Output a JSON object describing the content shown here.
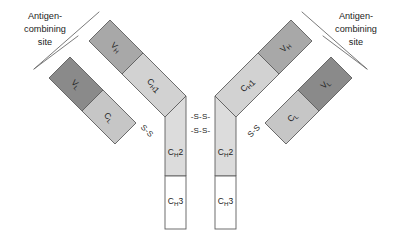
{
  "figure": {
    "background_color": "#ffffff",
    "outline_color": "#5d5d5d",
    "caption_partial": ""
  },
  "colors": {
    "variable_light": "#8a8a8a",
    "variable_heavy": "#a8a8a8",
    "constant_light": "#c6c6c6",
    "constant_heavy_1": "#d2d2d2",
    "constant_heavy_2": "#dcdcdc",
    "constant_heavy_3": "#ffffff",
    "outline": "#5d5d5d",
    "text": "#1c1c1c"
  },
  "labels": {
    "antigen_site_left": {
      "line1": "Antigen-",
      "line2": "combining",
      "line3": "site"
    },
    "antigen_site_right": {
      "line1": "Antigen-",
      "line2": "combining",
      "line3": "site"
    }
  },
  "domains": {
    "v_l_left": {
      "main": "V",
      "sub": "L",
      "tail": ""
    },
    "v_h_left": {
      "main": "V",
      "sub": "H",
      "tail": ""
    },
    "c_l_left": {
      "main": "C",
      "sub": "L",
      "tail": ""
    },
    "c_h1_left": {
      "main": "C",
      "sub": "H",
      "tail": "1"
    },
    "c_h2_left": {
      "main": "C",
      "sub": "H",
      "tail": "2"
    },
    "c_h3_left": {
      "main": "C",
      "sub": "H",
      "tail": "3"
    },
    "v_l_right": {
      "main": "V",
      "sub": "L",
      "tail": ""
    },
    "v_h_right": {
      "main": "V",
      "sub": "H",
      "tail": ""
    },
    "c_l_right": {
      "main": "C",
      "sub": "L",
      "tail": ""
    },
    "c_h1_right": {
      "main": "C",
      "sub": "H",
      "tail": "1"
    },
    "c_h2_right": {
      "main": "C",
      "sub": "H",
      "tail": "2"
    },
    "c_h3_right": {
      "main": "C",
      "sub": "H",
      "tail": "3"
    }
  },
  "bonds": {
    "hinge_upper": "-S-S-",
    "hinge_lower": "-S-S-",
    "light_heavy_left": "S-S",
    "light_heavy_right": "S-S"
  },
  "structure_notes": {
    "chain_count": 4,
    "heavy_chains": 2,
    "light_chains": 2,
    "antigen_binding_sites": 2,
    "interchain_disulfide_bonds": 4,
    "shape": "Y-shaped"
  }
}
